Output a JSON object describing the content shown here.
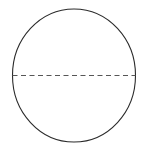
{
  "figure": {
    "kind": "geometry-diagram",
    "canvas": {
      "width": 146,
      "height": 149,
      "background_color": "#ffffff"
    },
    "shapes": {
      "circle": {
        "name": "circle-outline",
        "center_x": 74,
        "center_y": 75.5,
        "radius_x": 61.5,
        "radius_y": 66.5,
        "stroke_color": "#2b2b2b",
        "stroke_width": 1.1,
        "fill": "none"
      },
      "diameter": {
        "name": "dashed-diameter",
        "x1": 12.5,
        "y1": 75.5,
        "x2": 135.5,
        "y2": 75.5,
        "stroke_color": "#565656",
        "stroke_width": 1.1,
        "dash_length": 5,
        "gap_length": 3.5,
        "style": "dashed"
      }
    },
    "labels": []
  }
}
